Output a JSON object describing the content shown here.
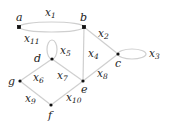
{
  "graph": {
    "nodes": [
      {
        "id": "a",
        "label": "a",
        "x": 19,
        "y": 27
      },
      {
        "id": "b",
        "label": "b",
        "x": 84,
        "y": 27
      },
      {
        "id": "c",
        "label": "c",
        "x": 118,
        "y": 54
      },
      {
        "id": "d",
        "label": "d",
        "x": 52,
        "y": 59
      },
      {
        "id": "e",
        "label": "e",
        "x": 83,
        "y": 81
      },
      {
        "id": "f",
        "label": "f",
        "x": 51,
        "y": 105
      },
      {
        "id": "g",
        "label": "g",
        "x": 20,
        "y": 81
      }
    ],
    "edges": [
      {
        "id": "x1",
        "base": "x",
        "sub": "1",
        "from": "a",
        "to": "b",
        "kind": "arc-top"
      },
      {
        "id": "x11",
        "base": "x",
        "sub": "11",
        "from": "a",
        "to": "b",
        "kind": "arc-bottom"
      },
      {
        "id": "x2",
        "base": "x",
        "sub": "2",
        "from": "b",
        "to": "c"
      },
      {
        "id": "x3",
        "base": "x",
        "sub": "3",
        "from": "c",
        "to": "c",
        "kind": "loop"
      },
      {
        "id": "x4",
        "base": "x",
        "sub": "4",
        "from": "b",
        "to": "e"
      },
      {
        "id": "x5",
        "base": "x",
        "sub": "5",
        "from": "d",
        "to": "d",
        "kind": "loop"
      },
      {
        "id": "x6",
        "base": "x",
        "sub": "6",
        "from": "g",
        "to": "d"
      },
      {
        "id": "x7",
        "base": "x",
        "sub": "7",
        "from": "d",
        "to": "e"
      },
      {
        "id": "x8",
        "base": "x",
        "sub": "8",
        "from": "e",
        "to": "c"
      },
      {
        "id": "x9",
        "base": "x",
        "sub": "9",
        "from": "g",
        "to": "f"
      },
      {
        "id": "x10",
        "base": "x",
        "sub": "10",
        "from": "f",
        "to": "e"
      }
    ]
  },
  "labels": {
    "a": "a",
    "b": "b",
    "c": "c",
    "d": "d",
    "e": "e",
    "f": "f",
    "g": "g",
    "x": "x",
    "s1": "1",
    "s2": "2",
    "s3": "3",
    "s4": "4",
    "s5": "5",
    "s6": "6",
    "s7": "7",
    "s8": "8",
    "s9": "9",
    "s10": "10",
    "s11": "11"
  },
  "colors": {
    "edge": "#cfcfcf",
    "node": "#111111",
    "text": "#222222"
  }
}
